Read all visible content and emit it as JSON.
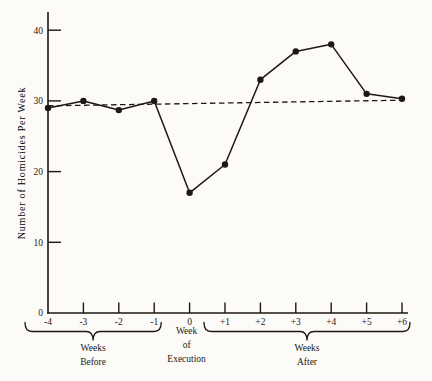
{
  "figure": {
    "background": "#fcfbf8",
    "ink_color": "#1c1814"
  },
  "chart_data": {
    "type": "line",
    "title": "",
    "xlabel": "",
    "ylabel": "Number of Homicides Per Week",
    "categories": [
      "-4",
      "-3",
      "-2",
      "-1",
      "0",
      "+1",
      "+2",
      "+3",
      "+4",
      "+5",
      "+6"
    ],
    "series": [
      {
        "name": "observed-homicides",
        "style": "solid-line-with-dot-markers",
        "values": [
          29,
          30,
          28.7,
          30,
          17,
          21,
          33,
          37,
          38,
          31,
          30.3
        ]
      },
      {
        "name": "baseline-trend",
        "style": "dashed-line",
        "values_endpoints": {
          "start": 29.3,
          "end": 30.1
        }
      }
    ],
    "ylim": [
      0,
      42.5
    ],
    "y_ticks": [
      "0",
      "10",
      "20",
      "30",
      "40"
    ],
    "y_tick_values": [
      0,
      10,
      20,
      30,
      40
    ],
    "grid": false,
    "legend": false,
    "annotations": {
      "weeks_before": {
        "lines": [
          "Weeks",
          "Before"
        ],
        "span": [
          "-4",
          "-1"
        ]
      },
      "week_of_execution": {
        "lines": [
          "Week",
          "of",
          "Execution"
        ],
        "at": "0"
      },
      "weeks_after": {
        "lines": [
          "Weeks",
          "After"
        ],
        "span": [
          "+1",
          "+6"
        ]
      }
    }
  }
}
